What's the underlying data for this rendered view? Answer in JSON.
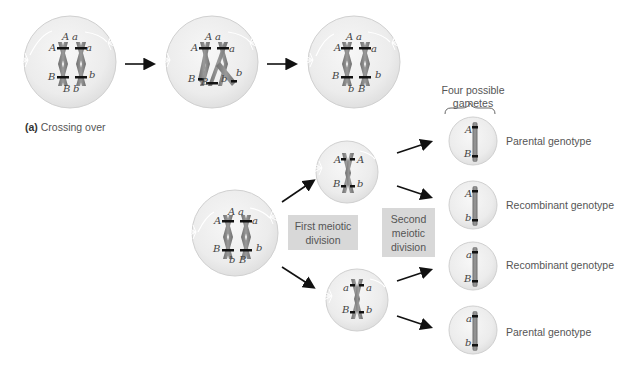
{
  "caption": {
    "letter": "(a)",
    "text": "Crossing over"
  },
  "gametes_header": {
    "line1": "Four possible",
    "line2": "gametes"
  },
  "division_labels": {
    "first": [
      "First meiotic",
      "division"
    ],
    "second": [
      "Second",
      "meiotic",
      "division"
    ]
  },
  "top_row_cells": [
    {
      "stage": "before crossing over",
      "top": [
        "A",
        "a"
      ],
      "left": "A",
      "right": "a",
      "lower_left": "B",
      "lower_right": "b",
      "bottom": [
        "B",
        "b"
      ]
    },
    {
      "stage": "during crossing over",
      "top": [
        "A",
        "a"
      ],
      "left": "A",
      "right": "a",
      "lower_left": "B",
      "lower_right": "b",
      "bottom": [
        "B",
        "b"
      ]
    },
    {
      "stage": "after crossing over",
      "top": [
        "A",
        "a"
      ],
      "left": "A",
      "right": "a",
      "lower_left": "B",
      "lower_right": "b",
      "bottom": [
        "b",
        "B"
      ]
    }
  ],
  "parent_cell": {
    "top": [
      "A",
      "a"
    ],
    "left": "A",
    "right": "a",
    "lower_left": "B",
    "lower_right": "b",
    "bottom": [
      "b",
      "B"
    ]
  },
  "daughter_cells": [
    {
      "left_top": "A",
      "right_top": "A",
      "left_bottom": "B",
      "right_bottom": "b"
    },
    {
      "left_top": "a",
      "right_top": "a",
      "left_bottom": "B",
      "right_bottom": "b"
    }
  ],
  "gametes": [
    {
      "top": "A",
      "bottom": "B",
      "genotype": "Parental genotype"
    },
    {
      "top": "A",
      "bottom": "b",
      "genotype": "Recombinant genotype"
    },
    {
      "top": "a",
      "bottom": "B",
      "genotype": "Recombinant genotype"
    },
    {
      "top": "a",
      "bottom": "b",
      "genotype": "Parental genotype"
    }
  ],
  "colors": {
    "cell_fill": "#ececec",
    "cell_stroke": "#cfcfcf",
    "chromosome": "#8a8a8a",
    "chromosome_dark": "#6e6e6e",
    "band": "#111111",
    "arrow": "#111111",
    "box_fill": "#d8d8d8",
    "text": "#555555"
  }
}
